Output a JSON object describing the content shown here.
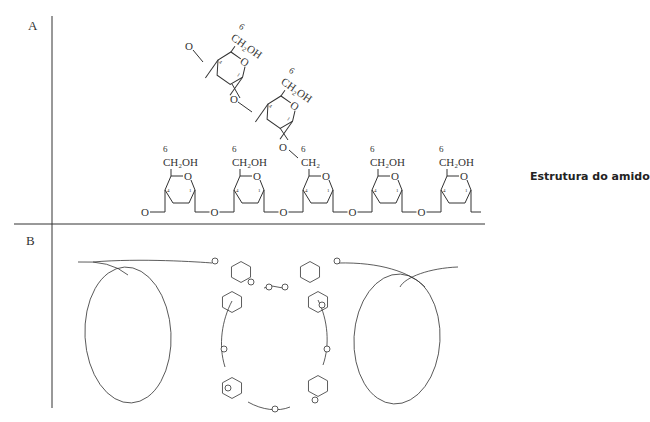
{
  "caption": "Estrutura do amido",
  "panels": {
    "a": {
      "label": "A"
    },
    "b": {
      "label": "B"
    }
  },
  "chem": {
    "position_6": "6",
    "ch2oh": "CH₂OH",
    "ch2": "CH₂",
    "oxygen": "O",
    "c4": "4",
    "c1": "1"
  },
  "colors": {
    "line": "#333333",
    "background": "#ffffff"
  }
}
